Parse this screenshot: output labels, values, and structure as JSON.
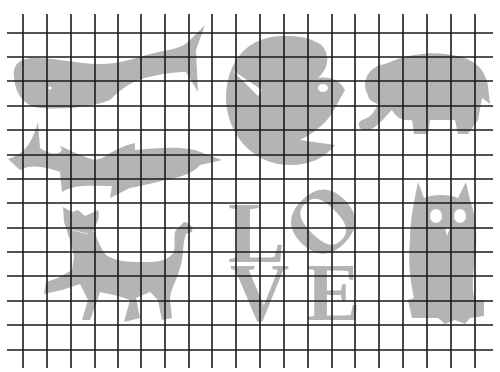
{
  "figure": {
    "background_color": "#ffffff",
    "silhouette_color": "#b4b4b4",
    "grid_color": "#1a1a1a",
    "grid": {
      "vertical_x": [
        23,
        47,
        71,
        95,
        118,
        141,
        165,
        189,
        212,
        236,
        260,
        284,
        308,
        332,
        355,
        379,
        403,
        427,
        451,
        475
      ],
      "horizontal_y": [
        33,
        57,
        81,
        106,
        130,
        155,
        179,
        203,
        228,
        252,
        276,
        301,
        325,
        350
      ],
      "vertical_span": [
        14,
        368
      ],
      "horizontal_span": [
        7,
        493
      ]
    },
    "silhouettes": [
      {
        "id": "whale",
        "label": "whale"
      },
      {
        "id": "bird-circle",
        "label": "bird in circle"
      },
      {
        "id": "elephant",
        "label": "elephant"
      },
      {
        "id": "shark",
        "label": "shark"
      },
      {
        "id": "cat",
        "label": "cat"
      },
      {
        "id": "love-sculpture",
        "label": "LOVE",
        "letters": [
          "L",
          "O",
          "V",
          "E"
        ]
      },
      {
        "id": "owl",
        "label": "owl"
      }
    ]
  }
}
